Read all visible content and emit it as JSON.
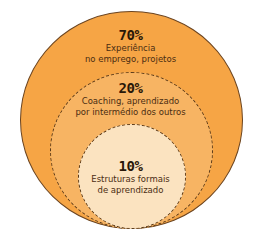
{
  "colors": {
    "outer": "#f6a545",
    "middle": "#f7b463",
    "inner": "#fbe3c0",
    "outline": "#5a3a1a",
    "text": "#3b2410"
  },
  "rings": [
    {
      "percent": "70%",
      "line1": "Experiência",
      "line2": "no emprego, projetos"
    },
    {
      "percent": "20%",
      "line1": "Coaching, aprendizado",
      "line2": "por intermédio dos outros"
    },
    {
      "percent": "10%",
      "line1": "Estruturas formais",
      "line2": "de aprendizado"
    }
  ]
}
